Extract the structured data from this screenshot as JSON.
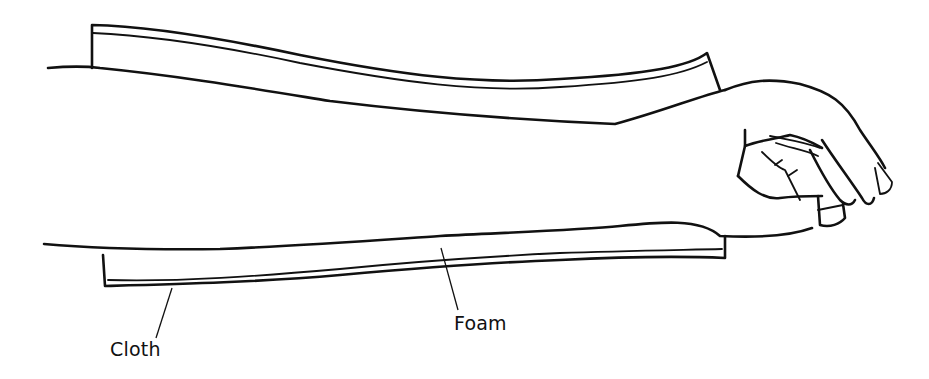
{
  "figure": {
    "labels": [
      {
        "id": "cloth",
        "text": "Cloth"
      },
      {
        "id": "foam",
        "text": "Foam"
      }
    ],
    "colors": {
      "line": "#111111",
      "background": "#ffffff"
    }
  }
}
